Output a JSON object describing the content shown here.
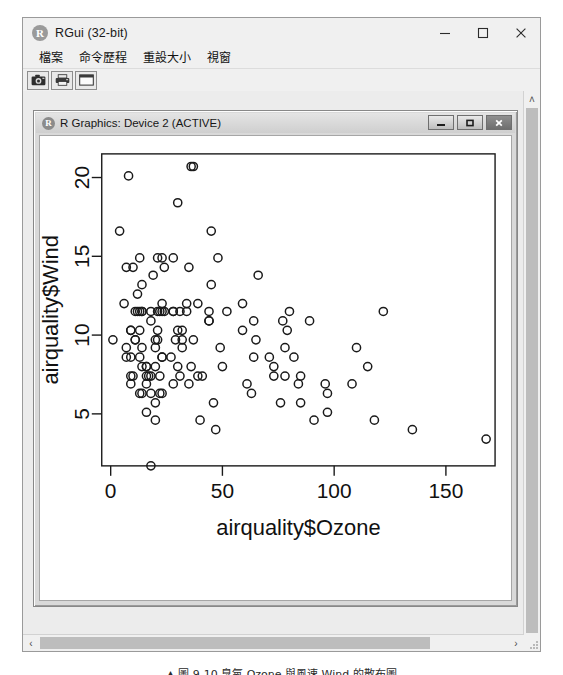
{
  "app": {
    "title": "RGui (32-bit)",
    "icon": "r-logo-icon",
    "window_buttons": {
      "minimize": "minimize-icon",
      "maximize": "maximize-icon",
      "close": "close-icon"
    },
    "menu": [
      {
        "label": "檔案"
      },
      {
        "label": "命令歷程"
      },
      {
        "label": "重設大小"
      },
      {
        "label": "視窗"
      }
    ],
    "toolbar": [
      {
        "name": "copy-to-clipboard-button",
        "icon": "camera-icon"
      },
      {
        "name": "print-button",
        "icon": "printer-icon"
      },
      {
        "name": "window-button",
        "icon": "window-icon"
      }
    ]
  },
  "graphics_window": {
    "title": "R Graphics: Device 2 (ACTIVE)",
    "icon": "r-logo-icon",
    "buttons": {
      "minimize": "minimize-icon",
      "restore": "restore-icon",
      "close": "close-icon"
    }
  },
  "scrollbars": {
    "vertical_up": "˄",
    "horizontal_left": "‹",
    "horizontal_right": "›"
  },
  "caption": "▲ 圖 9-10 臭氧 Ozone 與風速 Wind 的散布圖",
  "chart_data": {
    "type": "scatter",
    "title": "",
    "xlabel": "airquality$Ozone",
    "ylabel": "airquality$Wind",
    "xlim": [
      -4,
      172
    ],
    "ylim": [
      1.7,
      21.5
    ],
    "xticks": [
      0,
      50,
      100,
      150
    ],
    "yticks": [
      5,
      10,
      15,
      20
    ],
    "grid": false,
    "legend": null,
    "marker": "open-circle",
    "marker_color": "#1a1a1a",
    "points": [
      [
        41,
        7.4
      ],
      [
        36,
        8.0
      ],
      [
        12,
        12.6
      ],
      [
        18,
        11.5
      ],
      [
        28,
        14.9
      ],
      [
        23,
        8.6
      ],
      [
        19,
        13.8
      ],
      [
        8,
        20.1
      ],
      [
        7,
        8.6
      ],
      [
        16,
        6.9
      ],
      [
        11,
        9.7
      ],
      [
        14,
        9.2
      ],
      [
        18,
        10.9
      ],
      [
        14,
        13.2
      ],
      [
        34,
        11.5
      ],
      [
        6,
        12.0
      ],
      [
        30,
        18.4
      ],
      [
        11,
        11.5
      ],
      [
        1,
        9.7
      ],
      [
        11,
        9.7
      ],
      [
        4,
        16.6
      ],
      [
        32,
        9.7
      ],
      [
        23,
        12.0
      ],
      [
        45,
        16.6
      ],
      [
        115,
        8.0
      ],
      [
        37,
        9.7
      ],
      [
        29,
        9.7
      ],
      [
        71,
        8.6
      ],
      [
        39,
        12.0
      ],
      [
        23,
        11.5
      ],
      [
        21,
        14.9
      ],
      [
        37,
        20.7
      ],
      [
        20,
        9.2
      ],
      [
        12,
        11.5
      ],
      [
        13,
        10.3
      ],
      [
        135,
        4.0
      ],
      [
        49,
        9.2
      ],
      [
        32,
        9.2
      ],
      [
        64,
        10.9
      ],
      [
        40,
        4.6
      ],
      [
        77,
        10.9
      ],
      [
        97,
        5.1
      ],
      [
        97,
        6.3
      ],
      [
        85,
        5.7
      ],
      [
        10,
        7.4
      ],
      [
        27,
        8.6
      ],
      [
        7,
        14.3
      ],
      [
        48,
        14.9
      ],
      [
        35,
        14.3
      ],
      [
        61,
        6.9
      ],
      [
        79,
        10.3
      ],
      [
        63,
        6.3
      ],
      [
        16,
        5.1
      ],
      [
        80,
        11.5
      ],
      [
        108,
        6.9
      ],
      [
        20,
        9.7
      ],
      [
        52,
        11.5
      ],
      [
        82,
        8.6
      ],
      [
        50,
        8.0
      ],
      [
        64,
        8.6
      ],
      [
        59,
        12.0
      ],
      [
        39,
        7.4
      ],
      [
        9,
        7.4
      ],
      [
        16,
        7.4
      ],
      [
        78,
        9.2
      ],
      [
        35,
        6.9
      ],
      [
        66,
        13.8
      ],
      [
        122,
        11.5
      ],
      [
        89,
        10.9
      ],
      [
        110,
        9.2
      ],
      [
        44,
        10.9
      ],
      [
        28,
        11.5
      ],
      [
        65,
        9.7
      ],
      [
        22,
        11.5
      ],
      [
        59,
        10.3
      ],
      [
        23,
        6.3
      ],
      [
        31,
        7.4
      ],
      [
        44,
        10.9
      ],
      [
        21,
        10.3
      ],
      [
        9,
        6.9
      ],
      [
        45,
        13.2
      ],
      [
        168,
        3.4
      ],
      [
        73,
        8.0
      ],
      [
        76,
        5.7
      ],
      [
        118,
        4.6
      ],
      [
        84,
        6.9
      ],
      [
        85,
        7.4
      ],
      [
        96,
        6.9
      ],
      [
        78,
        7.4
      ],
      [
        73,
        7.4
      ],
      [
        91,
        4.6
      ],
      [
        47,
        4.0
      ],
      [
        32,
        10.3
      ],
      [
        20,
        8.0
      ],
      [
        23,
        8.6
      ],
      [
        21,
        11.5
      ],
      [
        24,
        11.5
      ],
      [
        44,
        11.5
      ],
      [
        21,
        9.7
      ],
      [
        28,
        11.5
      ],
      [
        9,
        10.3
      ],
      [
        13,
        6.3
      ],
      [
        46,
        5.7
      ],
      [
        18,
        7.4
      ],
      [
        13,
        8.6
      ],
      [
        24,
        14.3
      ],
      [
        16,
        8.0
      ],
      [
        13,
        11.5
      ],
      [
        23,
        14.9
      ],
      [
        36,
        20.7
      ],
      [
        7,
        9.2
      ],
      [
        14,
        11.5
      ],
      [
        30,
        10.3
      ],
      [
        14,
        6.3
      ],
      [
        18,
        1.7
      ],
      [
        20,
        4.6
      ],
      [
        22,
        6.3
      ],
      [
        14,
        8.0
      ],
      [
        30,
        8.0
      ],
      [
        9,
        8.6
      ],
      [
        14,
        11.5
      ],
      [
        18,
        6.3
      ],
      [
        20,
        5.7
      ],
      [
        28,
        6.9
      ],
      [
        17,
        7.4
      ],
      [
        22,
        7.4
      ],
      [
        34,
        12.0
      ],
      [
        9,
        10.3
      ],
      [
        10,
        14.3
      ],
      [
        16,
        8.0
      ],
      [
        31,
        11.5
      ],
      [
        13,
        14.9
      ]
    ]
  }
}
